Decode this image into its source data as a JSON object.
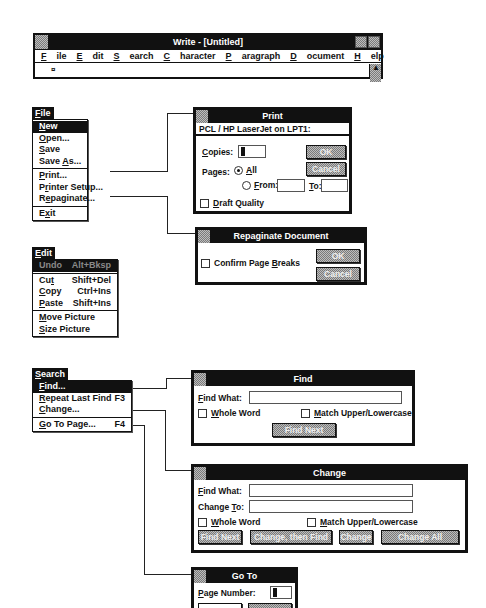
{
  "write_window": {
    "title": "Write - [Untitled]",
    "menus": [
      {
        "label": "File",
        "mnemonic": "F"
      },
      {
        "label": "Edit",
        "mnemonic": "E"
      },
      {
        "label": "Search",
        "mnemonic": "S"
      },
      {
        "label": "Character",
        "mnemonic": "C"
      },
      {
        "label": "Paragraph",
        "mnemonic": "P"
      },
      {
        "label": "Document",
        "mnemonic": "D"
      },
      {
        "label": "Help",
        "mnemonic": "H"
      }
    ],
    "end_mark": "¤",
    "icons": [
      "system-menu-icon",
      "minimize-icon",
      "maximize-icon",
      "scroll-up-arrow-icon"
    ]
  },
  "file_menu": {
    "title": "File",
    "items": [
      {
        "label": "New",
        "state": "selected"
      },
      {
        "label": "Open..."
      },
      {
        "label": "Save"
      },
      {
        "label": "Save As..."
      },
      {
        "separator": true
      },
      {
        "label": "Print..."
      },
      {
        "label": "Printer Setup..."
      },
      {
        "label": "Repaginate..."
      },
      {
        "separator": true
      },
      {
        "label": "Exit"
      }
    ]
  },
  "print_dialog": {
    "title": "Print",
    "printer": "PCL / HP LaserJet on LPT1:",
    "copies_label": "Copies:",
    "copies_value": "1",
    "pages_label": "Pages:",
    "all_label": "All",
    "from_label": "From:",
    "to_label": "To:",
    "from_value": "",
    "to_value": "",
    "draft_label": "Draft Quality",
    "ok_label": "OK",
    "cancel_label": "Cancel"
  },
  "repaginate_dialog": {
    "title": "Repaginate Document",
    "confirm_label": "Confirm Page Breaks",
    "ok_label": "OK",
    "cancel_label": "Cancel"
  },
  "edit_menu": {
    "title": "Edit",
    "items": [
      {
        "label": "Undo",
        "shortcut": "Alt+Bksp",
        "state": "disabled-highlighted"
      },
      {
        "separator": true
      },
      {
        "label": "Cut",
        "shortcut": "Shift+Del"
      },
      {
        "label": "Copy",
        "shortcut": "Ctrl+Ins"
      },
      {
        "label": "Paste",
        "shortcut": "Shift+Ins"
      },
      {
        "separator": true
      },
      {
        "label": "Move Picture",
        "shortcut": ""
      },
      {
        "label": "Size Picture",
        "shortcut": ""
      }
    ]
  },
  "search_menu": {
    "title": "Search",
    "items": [
      {
        "label": "Find...",
        "shortcut": "",
        "state": "selected"
      },
      {
        "label": "Repeat Last Find",
        "shortcut": "F3"
      },
      {
        "label": "Change...",
        "shortcut": ""
      },
      {
        "separator": true
      },
      {
        "label": "Go To Page...",
        "shortcut": "F4"
      }
    ]
  },
  "find_dialog": {
    "title": "Find",
    "find_what_label": "Find What:",
    "find_what_value": "",
    "whole_word_label": "Whole Word",
    "match_case_label": "Match Upper/Lowercase",
    "find_next_label": "Find Next"
  },
  "change_dialog": {
    "title": "Change",
    "find_what_label": "Find What:",
    "find_what_value": "",
    "change_to_label": "Change To:",
    "change_to_value": "",
    "whole_word_label": "Whole Word",
    "match_case_label": "Match Upper/Lowercase",
    "find_next_label": "Find Next",
    "change_then_find_label": "Change, then Find",
    "change_label": "Change",
    "change_all_label": "Change All"
  },
  "goto_dialog": {
    "title": "Go To",
    "page_number_label": "Page Number:",
    "page_number_value": "1",
    "ok_label": "OK",
    "cancel_label": "Cancel"
  }
}
